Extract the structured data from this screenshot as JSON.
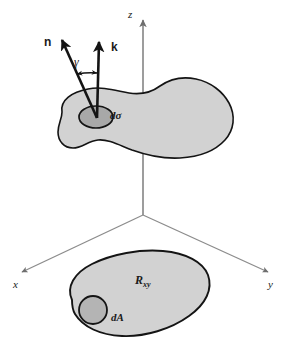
{
  "figure": {
    "background_color": "#ffffff",
    "width": 291,
    "height": 350
  },
  "colors": {
    "surface_fill": "#d2d2d2",
    "surface_stroke": "#141414",
    "element_fill": "#a8a8a8",
    "element_stroke": "#141414",
    "axis_line": "#8c8c8c",
    "vector_stroke": "#141414",
    "dashed_line": "#9a9a9a",
    "label_text": "#1a1a1a"
  },
  "axes": [
    {
      "id": "z",
      "label": "z",
      "label_x": 130,
      "label_y": 10,
      "direction": "up"
    },
    {
      "id": "x",
      "label": "x",
      "label_x": 14,
      "label_y": 283,
      "direction": "down-left"
    },
    {
      "id": "y",
      "label": "y",
      "label_x": 269,
      "label_y": 283,
      "direction": "down-right"
    }
  ],
  "origin": {
    "x": 143,
    "y": 215
  },
  "vectors": [
    {
      "id": "n",
      "label": "n",
      "label_x": 46,
      "label_y": 42,
      "tail_x": 97,
      "tail_y": 117,
      "head_x": 64,
      "head_y": 44,
      "description": "unit normal to the surface element"
    },
    {
      "id": "k",
      "label": "k",
      "label_x": 112,
      "label_y": 47,
      "tail_x": 97,
      "tail_y": 117,
      "head_x": 99,
      "head_y": 47,
      "description": "unit vertical vector along z"
    }
  ],
  "angle": {
    "id": "gamma",
    "label": "γ",
    "label_x": 76,
    "label_y": 62,
    "description": "angle between n and k"
  },
  "surface": {
    "name": "curved surface",
    "element": {
      "label": "dσ",
      "label_x": 110,
      "label_y": 110,
      "description": "differential surface element"
    }
  },
  "projection_region": {
    "label": "R",
    "label_sub": "xy",
    "label_x": 135,
    "label_y": 275,
    "element": {
      "label": "dA",
      "label_x": 78,
      "label_y": 312,
      "description": "differential area element in the xy-plane"
    }
  }
}
